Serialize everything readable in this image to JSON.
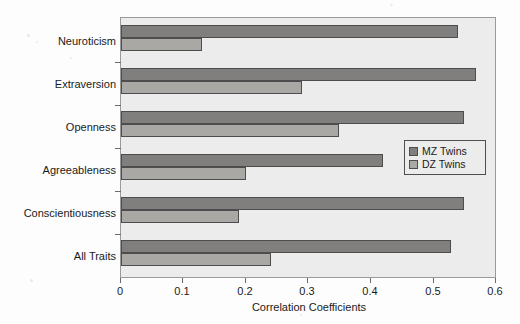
{
  "chart_data": {
    "type": "bar",
    "orientation": "horizontal",
    "title": "",
    "xlabel": "Correlation Coefficients",
    "ylabel": "",
    "xlim": [
      0,
      0.6
    ],
    "xticks": [
      "0",
      "0.1",
      "0.2",
      "0.3",
      "0.4",
      "0.5",
      "0.6"
    ],
    "xtick_values": [
      0,
      0.1,
      0.2,
      0.3,
      0.4,
      0.5,
      0.6
    ],
    "grid": false,
    "legend_position": "center right",
    "categories": [
      "Neuroticism",
      "Extraversion",
      "Openness",
      "Agreeableness",
      "Conscientiousness",
      "All Traits"
    ],
    "series": [
      {
        "name": "MZ Twins",
        "color": "#807f7e",
        "values": [
          0.54,
          0.57,
          0.55,
          0.42,
          0.55,
          0.53
        ]
      },
      {
        "name": "DZ Twins",
        "color": "#a9a8a5",
        "values": [
          0.13,
          0.29,
          0.35,
          0.2,
          0.19,
          0.24
        ]
      }
    ]
  },
  "legend": {
    "items": [
      {
        "label": "MZ Twins"
      },
      {
        "label": "DZ Twins"
      }
    ]
  },
  "colors": {
    "mz": "#807f7e",
    "dz": "#a9a8a5",
    "plot_background": "#ececec",
    "page_background": "#fdfdfd",
    "axis": "#6b6b6b",
    "text": "#1a1a1a"
  }
}
